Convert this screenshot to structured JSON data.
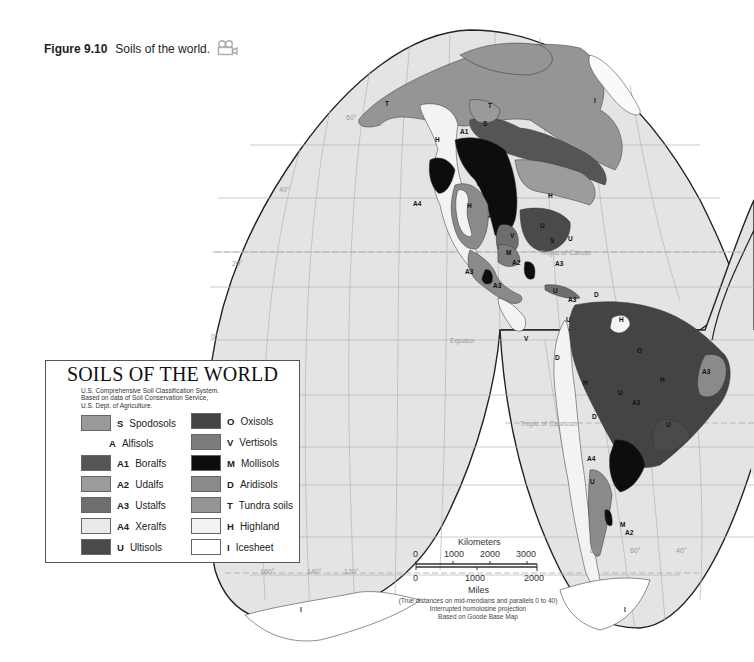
{
  "caption": {
    "figure_number": "Figure 9.10",
    "title": "Soils of the world.",
    "icon": "video-camera-icon"
  },
  "legend": {
    "title": "SOILS OF THE WORLD",
    "subtitle_lines": [
      "U.S. Comprehensive Soil Classification System.",
      "Based on data of Soil Conservation Service,",
      "U.S. Dept. of Agriculture."
    ],
    "left_column": [
      {
        "code": "S",
        "name": "Spodosols",
        "color": "#9a9a9a"
      },
      {
        "code": "A",
        "name": "Alfisols",
        "color": null
      },
      {
        "code": "A1",
        "name": "Boralfs",
        "color": "#555555"
      },
      {
        "code": "A2",
        "name": "Udalfs",
        "color": "#9c9c9c"
      },
      {
        "code": "A3",
        "name": "Ustalfs",
        "color": "#6e6e6e"
      },
      {
        "code": "A4",
        "name": "Xeralfs",
        "color": "#eaeaea"
      },
      {
        "code": "U",
        "name": "Ultisols",
        "color": "#4a4a4a"
      }
    ],
    "right_column": [
      {
        "code": "O",
        "name": "Oxisols",
        "color": "#444444"
      },
      {
        "code": "V",
        "name": "Vertisols",
        "color": "#7c7c7c"
      },
      {
        "code": "M",
        "name": "Mollisols",
        "color": "#0d0d0d"
      },
      {
        "code": "D",
        "name": "Aridisols",
        "color": "#8a8a8a"
      },
      {
        "code": "T",
        "name": "Tundra soils",
        "color": "#959595"
      },
      {
        "code": "H",
        "name": "Highland",
        "color": "#f2f2f2"
      },
      {
        "code": "I",
        "name": "Icesheet",
        "color": "#ffffff"
      }
    ]
  },
  "scale_bar": {
    "km_label": "Kilometers",
    "km_ticks": [
      "0",
      "1000",
      "2000",
      "3000"
    ],
    "mi_ticks": [
      "0",
      "1000",
      "2000"
    ],
    "mi_label": "Miles"
  },
  "notes": [
    "(True distances on mid-meridians and parallels 0 to 40)",
    "Interrupted homolosine projection",
    "Based on Goode Base Map"
  ],
  "map_labels": {
    "tropic_of_cancer": "Tropic of Cancer",
    "equator": "Equator",
    "tropic_of_capricorn": "Tropic of Capricorn",
    "lat_60": "60°",
    "lat_40": "40°",
    "lat_20": "20°",
    "lat_0": "0°",
    "lon_160": "160°",
    "lon_140": "140°",
    "lon_120": "120°",
    "lon_80": "80°",
    "lon_60": "60°",
    "lon_40": "40°"
  },
  "region_labels": {
    "north_america": [
      "T",
      "T",
      "I",
      "S",
      "A1",
      "H",
      "D",
      "H",
      "H",
      "A3",
      "U",
      "A4",
      "V",
      "S",
      "U",
      "M",
      "A2",
      "A3",
      "A3",
      "A3"
    ],
    "south_america": [
      "U",
      "A3",
      "D",
      "U",
      "H",
      "O",
      "D",
      "H",
      "U",
      "A3",
      "H",
      "A3",
      "D",
      "U",
      "A4",
      "U",
      "D",
      "M",
      "A2",
      "V"
    ],
    "antarctica": [
      "I",
      "I"
    ]
  },
  "colors": {
    "ocean": "#e4e4e4",
    "grid": "#b4b4b4",
    "outline": "#222222",
    "land_tundra": "#959595"
  }
}
